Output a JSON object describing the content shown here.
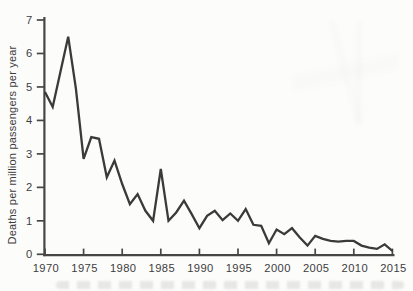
{
  "page": {
    "background": "#fcfcfb",
    "ink": "#3a3a3a",
    "axis_color": "#464646",
    "label_color": "#3d3d3d"
  },
  "chart_data": {
    "type": "line",
    "title": "",
    "xlabel": "",
    "ylabel": "Deaths per million passengers per year",
    "xlim": [
      1970,
      2015
    ],
    "ylim": [
      0,
      7
    ],
    "grid": false,
    "legend_position": "none",
    "x_ticks": [
      1970,
      1975,
      1980,
      1985,
      1990,
      1995,
      2000,
      2005,
      2010,
      2015
    ],
    "x_tick_labels": [
      "1970",
      "1975",
      "1980",
      "1985",
      "1990",
      "1995",
      "2000",
      "2005",
      "2010",
      "2015"
    ],
    "y_ticks": [
      0,
      1,
      2,
      3,
      4,
      5,
      6,
      7
    ],
    "y_tick_labels": [
      "0",
      "1",
      "2",
      "3",
      "4",
      "5",
      "6",
      "7"
    ],
    "line_color": "#3a3a3a",
    "series": [
      {
        "name": "deaths per million passengers per year",
        "x": [
          1970,
          1971,
          1972,
          1973,
          1974,
          1975,
          1976,
          1977,
          1978,
          1979,
          1980,
          1981,
          1982,
          1983,
          1984,
          1985,
          1986,
          1987,
          1988,
          1989,
          1990,
          1991,
          1992,
          1993,
          1994,
          1995,
          1996,
          1997,
          1998,
          1999,
          2000,
          2001,
          2002,
          2003,
          2004,
          2005,
          2006,
          2007,
          2008,
          2009,
          2010,
          2011,
          2012,
          2013,
          2014,
          2015
        ],
        "y": [
          4.85,
          4.4,
          5.45,
          6.5,
          4.95,
          2.85,
          3.5,
          3.45,
          2.3,
          2.8,
          2.1,
          1.5,
          1.8,
          1.3,
          1.0,
          2.55,
          1.0,
          1.25,
          1.6,
          1.2,
          0.78,
          1.15,
          1.3,
          1.02,
          1.22,
          1.0,
          1.35,
          0.88,
          0.85,
          0.33,
          0.74,
          0.6,
          0.78,
          0.5,
          0.26,
          0.55,
          0.46,
          0.4,
          0.38,
          0.4,
          0.4,
          0.26,
          0.2,
          0.16,
          0.3,
          0.1
        ]
      }
    ]
  }
}
